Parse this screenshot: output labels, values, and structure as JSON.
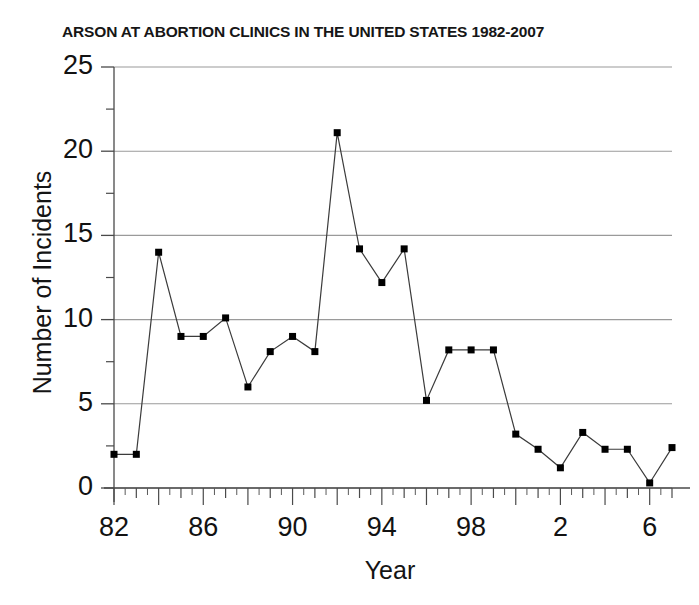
{
  "chart_data": {
    "type": "line",
    "title": "ARSON AT ABORTION CLINICS IN THE UNITED STATES 1982-2007",
    "xlabel": "Year",
    "ylabel": "Number of Incidents",
    "xlim": [
      1982,
      2007
    ],
    "ylim": [
      0,
      25
    ],
    "grid": true,
    "legend": "none",
    "marker": "square",
    "line_color": "#3b3b3b",
    "marker_color": "#000000",
    "grid_color": "#9a9a9a",
    "x": [
      1982,
      1983,
      1984,
      1985,
      1986,
      1987,
      1988,
      1989,
      1990,
      1991,
      1992,
      1993,
      1994,
      1995,
      1996,
      1997,
      1998,
      1999,
      2000,
      2001,
      2002,
      2003,
      2004,
      2005,
      2006,
      2007
    ],
    "values": [
      2.0,
      2.0,
      14.0,
      9.0,
      9.0,
      10.1,
      6.0,
      8.1,
      9.0,
      8.1,
      21.1,
      14.2,
      12.2,
      14.2,
      5.2,
      8.2,
      8.2,
      8.2,
      3.2,
      2.3,
      1.2,
      3.3,
      2.3,
      2.3,
      0.3,
      2.4
    ],
    "y_ticks": [
      0,
      5,
      10,
      15,
      20,
      25
    ],
    "y_tick_labels": [
      "0",
      "5",
      "10",
      "15",
      "20",
      "25"
    ],
    "y_minor_ticks": [
      2.5,
      7.5,
      12.5,
      17.5,
      22.5
    ],
    "x_tick_labels": [
      "82",
      "86",
      "90",
      "94",
      "98",
      "2",
      "6"
    ],
    "x_tick_years": [
      1982,
      1986,
      1990,
      1994,
      1998,
      2002,
      2006
    ]
  }
}
